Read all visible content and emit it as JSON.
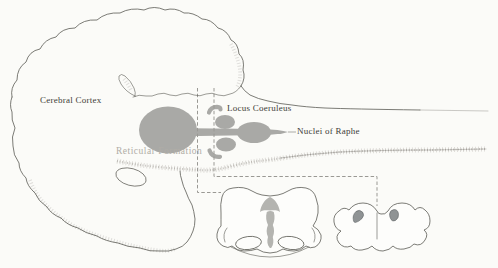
{
  "figure": {
    "type": "brain-sagittal-diagram-with-cross-sections",
    "labels": {
      "cerebral_cortex": "Cerebral Cortex",
      "locus_coeruleus": "Locus Coeruleus",
      "nuclei_of_raphe": "Nuclei of Raphe",
      "reticular_formation": "Reticular Formation"
    },
    "colors": {
      "background": "#fbfbf8",
      "outline": "#5b5a54",
      "nuclei_gray": "#a9a9a6",
      "arrow_gray": "#b4b4b0",
      "coeruleus_dark_gray": "#8f9394",
      "label_dark": "#3d3c37",
      "label_gray": "#b0ada6",
      "dashed_line": "#9a9994"
    }
  }
}
